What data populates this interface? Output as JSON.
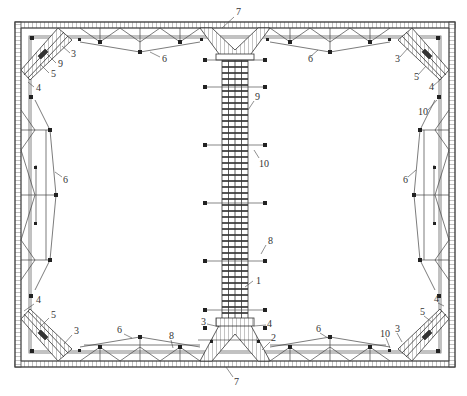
{
  "diagram": {
    "type": "structural plan view - steel support / bracing system in excavation",
    "colors": {
      "line": "#444444",
      "fill_dark": "#222222",
      "background": "#ffffff",
      "hatch": "#666666"
    },
    "frame": {
      "outer": {
        "x": 15,
        "y": 22,
        "w": 440,
        "h": 345
      },
      "wall_thickness": 6
    },
    "labels": [
      {
        "text": "7",
        "x": 236,
        "y": 15,
        "lx1": 234,
        "ly1": 17,
        "lx2": 222,
        "ly2": 28
      },
      {
        "text": "3",
        "x": 71,
        "y": 57,
        "lx1": 70,
        "ly1": 53,
        "lx2": 62,
        "ly2": 46
      },
      {
        "text": "9",
        "x": 58,
        "y": 67,
        "lx1": 56,
        "ly1": 63,
        "lx2": 47,
        "ly2": 54
      },
      {
        "text": "5",
        "x": 51,
        "y": 77,
        "lx1": 49,
        "ly1": 73,
        "lx2": 40,
        "ly2": 64
      },
      {
        "text": "4",
        "x": 36,
        "y": 91,
        "lx1": 34,
        "ly1": 87,
        "lx2": 28,
        "ly2": 82
      },
      {
        "text": "6",
        "x": 162,
        "y": 62,
        "lx1": 160,
        "ly1": 57,
        "lx2": 150,
        "ly2": 52
      },
      {
        "text": "6",
        "x": 308,
        "y": 62,
        "lx1": 310,
        "ly1": 57,
        "lx2": 318,
        "ly2": 50
      },
      {
        "text": "3",
        "x": 395,
        "y": 62,
        "lx1": 400,
        "ly1": 57,
        "lx2": 408,
        "ly2": 48
      },
      {
        "text": "5",
        "x": 414,
        "y": 80,
        "lx1": 418,
        "ly1": 75,
        "lx2": 426,
        "ly2": 66
      },
      {
        "text": "4",
        "x": 429,
        "y": 90,
        "lx1": 433,
        "ly1": 86,
        "lx2": 440,
        "ly2": 80
      },
      {
        "text": "10",
        "x": 418,
        "y": 115,
        "lx1": 428,
        "ly1": 110,
        "lx2": 437,
        "ly2": 100
      },
      {
        "text": "9",
        "x": 255,
        "y": 100,
        "lx1": 254,
        "ly1": 101,
        "lx2": 248,
        "ly2": 110
      },
      {
        "text": "10",
        "x": 259,
        "y": 167,
        "lx1": 259,
        "ly1": 158,
        "lx2": 254,
        "ly2": 150
      },
      {
        "text": "6",
        "x": 63,
        "y": 183,
        "lx1": 62,
        "ly1": 177,
        "lx2": 55,
        "ly2": 172
      },
      {
        "text": "6",
        "x": 403,
        "y": 183,
        "lx1": 408,
        "ly1": 177,
        "lx2": 416,
        "ly2": 170
      },
      {
        "text": "8",
        "x": 268,
        "y": 244,
        "lx1": 266,
        "ly1": 245,
        "lx2": 261,
        "ly2": 254
      },
      {
        "text": "1",
        "x": 256,
        "y": 284,
        "lx1": 253,
        "ly1": 281,
        "lx2": 245,
        "ly2": 287
      },
      {
        "text": "4",
        "x": 36,
        "y": 303,
        "lx1": 34,
        "ly1": 304,
        "lx2": 24,
        "ly2": 311
      },
      {
        "text": "5",
        "x": 51,
        "y": 318,
        "lx1": 49,
        "ly1": 318,
        "lx2": 40,
        "ly2": 327
      },
      {
        "text": "3",
        "x": 74,
        "y": 334,
        "lx1": 72,
        "ly1": 335,
        "lx2": 64,
        "ly2": 344
      },
      {
        "text": "6",
        "x": 117,
        "y": 333,
        "lx1": 124,
        "ly1": 334,
        "lx2": 132,
        "ly2": 338
      },
      {
        "text": "8",
        "x": 169,
        "y": 339,
        "lx1": 171,
        "ly1": 340,
        "lx2": 173,
        "ly2": 348
      },
      {
        "text": "3",
        "x": 201,
        "y": 325,
        "lx1": 207,
        "ly1": 324,
        "lx2": 220,
        "ly2": 327
      },
      {
        "text": "4",
        "x": 267,
        "y": 327,
        "lx1": 266,
        "ly1": 325,
        "lx2": 254,
        "ly2": 326
      },
      {
        "text": "2",
        "x": 271,
        "y": 341,
        "lx1": 270,
        "ly1": 342,
        "lx2": 262,
        "ly2": 350
      },
      {
        "text": "6",
        "x": 316,
        "y": 332,
        "lx1": 320,
        "ly1": 333,
        "lx2": 328,
        "ly2": 338
      },
      {
        "text": "10",
        "x": 380,
        "y": 337,
        "lx1": 386,
        "ly1": 338,
        "lx2": 390,
        "ly2": 348
      },
      {
        "text": "3",
        "x": 395,
        "y": 332,
        "lx1": 397,
        "ly1": 333,
        "lx2": 402,
        "ly2": 342
      },
      {
        "text": "4",
        "x": 434,
        "y": 302,
        "lx1": 438,
        "ly1": 303,
        "lx2": 444,
        "ly2": 306
      },
      {
        "text": "5",
        "x": 420,
        "y": 315,
        "lx1": 424,
        "ly1": 316,
        "lx2": 432,
        "ly2": 322
      },
      {
        "text": "7",
        "x": 234,
        "y": 385,
        "lx1": 233,
        "ly1": 377,
        "lx2": 226,
        "ly2": 367
      }
    ]
  }
}
